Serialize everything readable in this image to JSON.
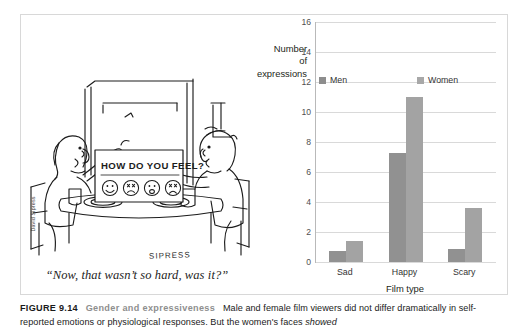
{
  "figure": {
    "number_label": "FIGURE 9.14",
    "title": "Gender and expressiveness",
    "body_before_emphasis": "Male and female film viewers did not differ dramatically in self-reported emotions or physiological responses. But the women's faces ",
    "emphasis": "showed",
    "title_color": "#8e8e8e"
  },
  "cartoon": {
    "credit": "David Sipress",
    "signature": "SIPRESS",
    "caption": "“Now, that wasn’t so hard, was it?”",
    "sign_text": "HOW DO YOU FEEL?",
    "faces": [
      "smile-face",
      "frown-face",
      "neutral-face",
      "sad-face"
    ]
  },
  "chart_data": {
    "type": "bar",
    "title": "",
    "categories": [
      "Sad",
      "Happy",
      "Scary"
    ],
    "series": [
      {
        "name": "Men",
        "values": [
          0.75,
          7.3,
          0.9
        ],
        "color": "#919191"
      },
      {
        "name": "Women",
        "values": [
          1.4,
          11.0,
          3.6
        ],
        "color": "#a3a3a3"
      }
    ],
    "xlabel": "Film type",
    "ylabel": "Number of expressions",
    "ylabel_lines": [
      "Number",
      "of",
      "expressions"
    ],
    "ylim": [
      0,
      16
    ],
    "ytick_step": 2,
    "yticks": [
      0,
      2,
      4,
      6,
      8,
      10,
      12,
      14,
      16
    ],
    "ytick_labels": [
      "0",
      "2",
      "4",
      "6",
      "8",
      "10",
      "12",
      "14",
      "16"
    ],
    "grid": true,
    "grid_axis": "y",
    "legend": true,
    "legend_position": "inside-top",
    "legend_entries": [
      "Men",
      "Women"
    ]
  }
}
